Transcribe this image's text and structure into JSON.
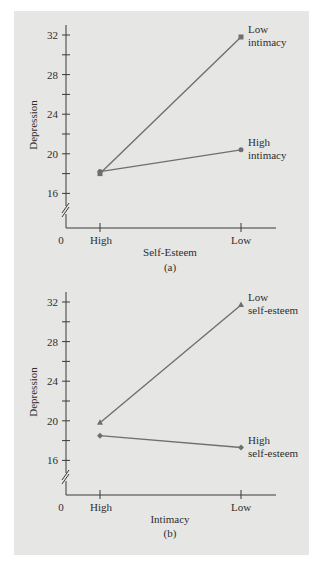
{
  "chart_data": [
    {
      "type": "line",
      "panel_label": "(a)",
      "title": "",
      "xlabel": "Self-Esteem",
      "ylabel": "Depression",
      "x_origin_label": "0",
      "categories": [
        "High",
        "Low"
      ],
      "yticks": [
        16,
        20,
        24,
        28,
        32
      ],
      "ylim": [
        13,
        33
      ],
      "axis_break": true,
      "series": [
        {
          "name": "Low intimacy",
          "label_lines": [
            "Low",
            "intimacy"
          ],
          "values": [
            18.0,
            31.8
          ],
          "marker": "square"
        },
        {
          "name": "High intimacy",
          "label_lines": [
            "High",
            "intimacy"
          ],
          "values": [
            18.2,
            20.4
          ],
          "marker": "circle"
        }
      ]
    },
    {
      "type": "line",
      "panel_label": "(b)",
      "title": "",
      "xlabel": "Intimacy",
      "ylabel": "Depression",
      "x_origin_label": "0",
      "categories": [
        "High",
        "Low"
      ],
      "yticks": [
        16,
        20,
        24,
        28,
        32
      ],
      "ylim": [
        13,
        33
      ],
      "axis_break": true,
      "series": [
        {
          "name": "Low self-esteem",
          "label_lines": [
            "Low",
            "self-esteem"
          ],
          "values": [
            19.8,
            31.7
          ],
          "marker": "triangle"
        },
        {
          "name": "High self-esteem",
          "label_lines": [
            "High",
            "self-esteem"
          ],
          "values": [
            18.5,
            17.3
          ],
          "marker": "diamond"
        }
      ]
    }
  ],
  "colors": {
    "background": "#ffffff",
    "panel": "#e6e6e4",
    "axis": "#3a3a3a",
    "line": "#6f6f6f",
    "text": "#2e2e2e"
  }
}
